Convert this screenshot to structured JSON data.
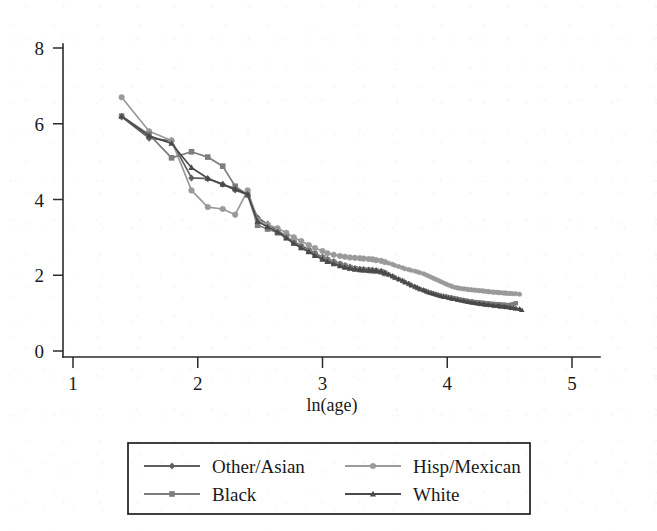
{
  "chart_data": {
    "type": "line",
    "title": "",
    "xlabel": "ln(age)",
    "ylabel": "",
    "xlim": [
      1,
      5
    ],
    "ylim": [
      0,
      8
    ],
    "xticks": [
      1,
      2,
      3,
      4,
      5
    ],
    "yticks": [
      0,
      2,
      4,
      6,
      8
    ],
    "xtick_labels": [
      "1",
      "2",
      "3",
      "4",
      "5"
    ],
    "ytick_labels": [
      "0",
      "2",
      "4",
      "6",
      "8"
    ],
    "grid": false,
    "legend_position": "below-axes",
    "series": [
      {
        "name": "Other/Asian",
        "color": "#5f5f5f",
        "marker": "diamond",
        "x": [
          1.39,
          1.61,
          1.79,
          1.95,
          2.08,
          2.2,
          2.3,
          2.4,
          2.48,
          2.56,
          2.64,
          2.71,
          2.77,
          2.83,
          2.89,
          2.94,
          3.0,
          3.04,
          3.09,
          3.14,
          3.18,
          3.22,
          3.26,
          3.3,
          3.33,
          3.37,
          3.4,
          3.43,
          3.47,
          3.5,
          3.53,
          3.56,
          3.58,
          3.61,
          3.64,
          3.66,
          3.69,
          3.71,
          3.74,
          3.76,
          3.78,
          3.81,
          3.83,
          3.85,
          3.87,
          3.89,
          3.91,
          3.93,
          3.95,
          3.97,
          3.99,
          4.01,
          4.03,
          4.04,
          4.06,
          4.08,
          4.09,
          4.11,
          4.13,
          4.14,
          4.16,
          4.17,
          4.19,
          4.2,
          4.22,
          4.23,
          4.25,
          4.26,
          4.28,
          4.29,
          4.3,
          4.32,
          4.33,
          4.34,
          4.36,
          4.37,
          4.38,
          4.4,
          4.41,
          4.42,
          4.43,
          4.45,
          4.46,
          4.47,
          4.48,
          4.5,
          4.51,
          4.53,
          4.55,
          4.58
        ],
        "y": [
          6.18,
          5.62,
          5.55,
          4.57,
          4.55,
          4.4,
          4.25,
          4.12,
          3.52,
          3.35,
          3.18,
          3.02,
          2.88,
          2.78,
          2.68,
          2.58,
          2.48,
          2.42,
          2.36,
          2.3,
          2.26,
          2.22,
          2.18,
          2.16,
          2.15,
          2.14,
          2.13,
          2.12,
          2.1,
          2.06,
          2.02,
          1.98,
          1.94,
          1.9,
          1.86,
          1.82,
          1.78,
          1.74,
          1.7,
          1.67,
          1.64,
          1.61,
          1.58,
          1.56,
          1.54,
          1.52,
          1.5,
          1.48,
          1.46,
          1.45,
          1.44,
          1.42,
          1.41,
          1.4,
          1.39,
          1.38,
          1.36,
          1.35,
          1.34,
          1.33,
          1.32,
          1.31,
          1.3,
          1.29,
          1.28,
          1.27,
          1.26,
          1.25,
          1.25,
          1.24,
          1.23,
          1.23,
          1.22,
          1.22,
          1.21,
          1.21,
          1.2,
          1.2,
          1.19,
          1.19,
          1.18,
          1.18,
          1.17,
          1.17,
          1.16,
          1.15,
          1.14,
          1.13,
          1.12,
          1.1
        ]
      },
      {
        "name": "Hisp/Mexican",
        "color": "#9a9a9a",
        "marker": "circle",
        "x": [
          1.39,
          1.61,
          1.79,
          1.95,
          2.08,
          2.2,
          2.3,
          2.4,
          2.48,
          2.56,
          2.64,
          2.71,
          2.77,
          2.83,
          2.89,
          2.94,
          3.0,
          3.04,
          3.09,
          3.14,
          3.18,
          3.22,
          3.26,
          3.3,
          3.33,
          3.37,
          3.4,
          3.43,
          3.47,
          3.5,
          3.53,
          3.56,
          3.58,
          3.61,
          3.64,
          3.66,
          3.69,
          3.71,
          3.74,
          3.76,
          3.78,
          3.81,
          3.83,
          3.85,
          3.87,
          3.89,
          3.91,
          3.93,
          3.95,
          3.97,
          3.99,
          4.01,
          4.03,
          4.04,
          4.06,
          4.08,
          4.09,
          4.11,
          4.13,
          4.14,
          4.16,
          4.17,
          4.19,
          4.2,
          4.22,
          4.23,
          4.25,
          4.26,
          4.28,
          4.29,
          4.3,
          4.32,
          4.33,
          4.34,
          4.36,
          4.37,
          4.38,
          4.4,
          4.41,
          4.42,
          4.43,
          4.45,
          4.46,
          4.47,
          4.48,
          4.5,
          4.51,
          4.53,
          4.55,
          4.58
        ],
        "y": [
          6.7,
          5.8,
          5.56,
          4.24,
          3.8,
          3.75,
          3.6,
          4.24,
          3.46,
          3.34,
          3.24,
          3.12,
          3.0,
          2.9,
          2.8,
          2.72,
          2.64,
          2.58,
          2.54,
          2.51,
          2.49,
          2.47,
          2.46,
          2.45,
          2.44,
          2.43,
          2.42,
          2.4,
          2.38,
          2.35,
          2.32,
          2.29,
          2.26,
          2.23,
          2.2,
          2.17,
          2.15,
          2.13,
          2.11,
          2.09,
          2.07,
          2.04,
          2.01,
          1.98,
          1.95,
          1.92,
          1.89,
          1.86,
          1.83,
          1.8,
          1.77,
          1.74,
          1.72,
          1.7,
          1.68,
          1.67,
          1.66,
          1.65,
          1.64,
          1.64,
          1.63,
          1.62,
          1.62,
          1.61,
          1.61,
          1.6,
          1.6,
          1.59,
          1.59,
          1.58,
          1.58,
          1.57,
          1.57,
          1.56,
          1.56,
          1.55,
          1.55,
          1.55,
          1.54,
          1.54,
          1.54,
          1.53,
          1.53,
          1.53,
          1.52,
          1.52,
          1.52,
          1.51,
          1.51,
          1.5
        ]
      },
      {
        "name": "Black",
        "color": "#7d7d7d",
        "marker": "square",
        "x": [
          1.39,
          1.61,
          1.79,
          1.95,
          2.08,
          2.2,
          2.3,
          2.4,
          2.48,
          2.56,
          2.64,
          2.71,
          2.77,
          2.83,
          2.89,
          2.94,
          3.0,
          3.04,
          3.09,
          3.14,
          3.18,
          3.22,
          3.26,
          3.3,
          3.33,
          3.37,
          3.4,
          3.43,
          3.47,
          3.5,
          3.53,
          3.56,
          3.58,
          3.61,
          3.64,
          3.66,
          3.69,
          3.71,
          3.74,
          3.76,
          3.78,
          3.81,
          3.83,
          3.85,
          3.87,
          3.89,
          3.91,
          3.93,
          3.95,
          3.97,
          3.99,
          4.01,
          4.03,
          4.04,
          4.06,
          4.08,
          4.09,
          4.11,
          4.13,
          4.14,
          4.16,
          4.17,
          4.19,
          4.2,
          4.22,
          4.23,
          4.25,
          4.26,
          4.28,
          4.29,
          4.3,
          4.32,
          4.33,
          4.34,
          4.36,
          4.37,
          4.38,
          4.4,
          4.41,
          4.42,
          4.43,
          4.45,
          4.46,
          4.47,
          4.48,
          4.5,
          4.51,
          4.53,
          4.55
        ],
        "y": [
          6.2,
          5.72,
          5.1,
          5.26,
          5.12,
          4.88,
          4.35,
          4.12,
          3.32,
          3.22,
          3.12,
          3.0,
          2.86,
          2.74,
          2.64,
          2.56,
          2.46,
          2.4,
          2.34,
          2.29,
          2.24,
          2.2,
          2.17,
          2.15,
          2.14,
          2.13,
          2.12,
          2.11,
          2.09,
          2.05,
          2.01,
          1.97,
          1.93,
          1.89,
          1.85,
          1.81,
          1.77,
          1.73,
          1.69,
          1.66,
          1.63,
          1.6,
          1.57,
          1.55,
          1.53,
          1.51,
          1.49,
          1.47,
          1.45,
          1.44,
          1.43,
          1.41,
          1.4,
          1.39,
          1.38,
          1.37,
          1.36,
          1.35,
          1.34,
          1.33,
          1.32,
          1.31,
          1.31,
          1.3,
          1.29,
          1.29,
          1.28,
          1.28,
          1.27,
          1.27,
          1.26,
          1.26,
          1.25,
          1.25,
          1.24,
          1.24,
          1.24,
          1.23,
          1.23,
          1.23,
          1.22,
          1.22,
          1.22,
          1.21,
          1.21,
          1.21,
          1.22,
          1.24,
          1.26
        ]
      },
      {
        "name": "White",
        "color": "#4a4a4a",
        "marker": "triangle",
        "x": [
          1.39,
          1.61,
          1.79,
          1.95,
          2.08,
          2.2,
          2.3,
          2.4,
          2.48,
          2.56,
          2.64,
          2.71,
          2.77,
          2.83,
          2.89,
          2.94,
          3.0,
          3.04,
          3.09,
          3.14,
          3.18,
          3.22,
          3.26,
          3.3,
          3.33,
          3.37,
          3.4,
          3.43,
          3.47,
          3.5,
          3.53,
          3.56,
          3.58,
          3.61,
          3.64,
          3.66,
          3.69,
          3.71,
          3.74,
          3.76,
          3.78,
          3.81,
          3.83,
          3.85,
          3.87,
          3.89,
          3.91,
          3.93,
          3.95,
          3.97,
          3.99,
          4.01,
          4.03,
          4.04,
          4.06,
          4.08,
          4.09,
          4.11,
          4.13,
          4.14,
          4.16,
          4.17,
          4.19,
          4.2,
          4.22,
          4.23,
          4.25,
          4.26,
          4.28,
          4.29,
          4.3,
          4.32,
          4.33,
          4.34,
          4.36,
          4.37,
          4.38,
          4.4,
          4.41,
          4.42,
          4.43,
          4.45,
          4.46,
          4.47,
          4.48,
          4.5,
          4.51,
          4.53,
          4.55,
          4.58,
          4.6
        ],
        "y": [
          6.2,
          5.68,
          5.48,
          4.84,
          4.56,
          4.4,
          4.28,
          4.14,
          3.42,
          3.28,
          3.14,
          2.98,
          2.84,
          2.72,
          2.62,
          2.52,
          2.42,
          2.36,
          2.3,
          2.25,
          2.21,
          2.18,
          2.16,
          2.15,
          2.14,
          2.13,
          2.13,
          2.12,
          2.1,
          2.06,
          2.02,
          1.98,
          1.94,
          1.9,
          1.86,
          1.82,
          1.78,
          1.74,
          1.7,
          1.67,
          1.64,
          1.61,
          1.58,
          1.55,
          1.53,
          1.51,
          1.49,
          1.47,
          1.45,
          1.43,
          1.42,
          1.4,
          1.39,
          1.38,
          1.37,
          1.35,
          1.34,
          1.33,
          1.32,
          1.31,
          1.3,
          1.29,
          1.28,
          1.28,
          1.27,
          1.26,
          1.25,
          1.25,
          1.24,
          1.23,
          1.23,
          1.22,
          1.22,
          1.21,
          1.21,
          1.2,
          1.2,
          1.19,
          1.19,
          1.18,
          1.18,
          1.17,
          1.17,
          1.16,
          1.16,
          1.15,
          1.14,
          1.13,
          1.12,
          1.11,
          1.08
        ]
      }
    ]
  },
  "legend": {
    "entries": [
      {
        "label": "Other/Asian",
        "marker": "diamond",
        "color": "#5f5f5f"
      },
      {
        "label": "Hisp/Mexican",
        "marker": "circle",
        "color": "#9a9a9a"
      },
      {
        "label": "Black",
        "marker": "square",
        "color": "#7d7d7d"
      },
      {
        "label": "White",
        "marker": "triangle",
        "color": "#4a4a4a"
      }
    ]
  },
  "axes": {
    "x_title": "ln(age)"
  }
}
